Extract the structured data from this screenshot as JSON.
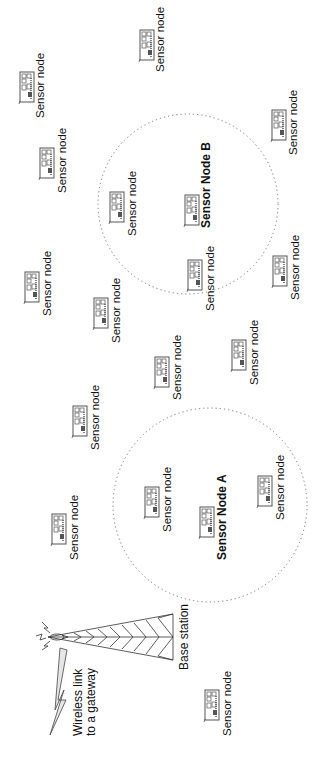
{
  "diagram": {
    "orientation": "rotated -90deg",
    "base_station": {
      "label": "Base station"
    },
    "gateway_link": {
      "label_line1": "Wireless link",
      "label_line2": "to a gateway"
    },
    "clusters": [
      {
        "name": "Sensor Node A",
        "label": "Sensor Node A"
      },
      {
        "name": "Sensor Node B",
        "label": "Sensor Node B"
      }
    ],
    "nodes": [
      {
        "label": "Sensor node",
        "x": 20,
        "y": 72,
        "lx": 35,
        "ly": 118
      },
      {
        "label": "Sensor node",
        "x": 140,
        "y": 30,
        "lx": 155,
        "ly": 72
      },
      {
        "label": "Sensor node",
        "x": 272,
        "y": 110,
        "lx": 288,
        "ly": 155
      },
      {
        "label": "Sensor node",
        "x": 40,
        "y": 148,
        "lx": 57,
        "ly": 193
      },
      {
        "label": "Sensor node",
        "x": 110,
        "y": 192,
        "lx": 127,
        "ly": 236
      },
      {
        "label": "Sensor Node B",
        "x": 185,
        "y": 195,
        "lx": 200,
        "ly": 228,
        "bold": true
      },
      {
        "label": "Sensor node",
        "x": 188,
        "y": 260,
        "lx": 205,
        "ly": 311
      },
      {
        "label": "Sensor node",
        "x": 273,
        "y": 256,
        "lx": 290,
        "ly": 300
      },
      {
        "label": "Sensor node",
        "x": 25,
        "y": 272,
        "lx": 42,
        "ly": 316
      },
      {
        "label": "Sensor node",
        "x": 94,
        "y": 298,
        "lx": 111,
        "ly": 343
      },
      {
        "label": "Sensor node",
        "x": 155,
        "y": 357,
        "lx": 172,
        "ly": 400
      },
      {
        "label": "Sensor node",
        "x": 232,
        "y": 340,
        "lx": 249,
        "ly": 385
      },
      {
        "label": "Sensor node",
        "x": 73,
        "y": 406,
        "lx": 90,
        "ly": 450
      },
      {
        "label": "Sensor node",
        "x": 52,
        "y": 514,
        "lx": 69,
        "ly": 560
      },
      {
        "label": "Sensor node",
        "x": 145,
        "y": 487,
        "lx": 162,
        "ly": 532
      },
      {
        "label": "Sensor Node A",
        "x": 200,
        "y": 507,
        "lx": 216,
        "ly": 560,
        "bold": true
      },
      {
        "label": "Sensor node",
        "x": 258,
        "y": 476,
        "lx": 275,
        "ly": 520
      },
      {
        "label": "Sensor node",
        "x": 205,
        "y": 690,
        "lx": 222,
        "ly": 736
      }
    ],
    "colors": {
      "ink": "#111111",
      "icon_stroke": "#444444",
      "dotted": "#777777",
      "lightning_fill": "#e6e6e6"
    }
  }
}
